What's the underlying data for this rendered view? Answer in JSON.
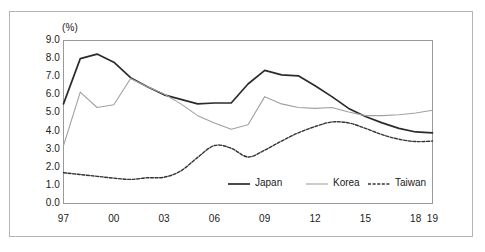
{
  "chart_data": {
    "type": "line",
    "title": "",
    "subtitle": "",
    "xlabel": "",
    "ylabel": "",
    "unit_label": "(%)",
    "x": [
      1997,
      1998,
      1999,
      2000,
      2001,
      2002,
      2003,
      2004,
      2005,
      2006,
      2007,
      2008,
      2009,
      2010,
      2011,
      2012,
      2013,
      2014,
      2015,
      2016,
      2017,
      2018,
      2019
    ],
    "xtick_labels": [
      "97",
      "00",
      "03",
      "06",
      "09",
      "12",
      "15",
      "18",
      "19"
    ],
    "xtick_values": [
      1997,
      2000,
      2003,
      2006,
      2009,
      2012,
      2015,
      2018,
      2019
    ],
    "ytick_labels": [
      "0.0",
      "1.0",
      "2.0",
      "3.0",
      "4.0",
      "5.0",
      "6.0",
      "7.0",
      "8.0",
      "9.0"
    ],
    "ytick_values": [
      0.0,
      1.0,
      2.0,
      3.0,
      4.0,
      5.0,
      6.0,
      7.0,
      8.0,
      9.0
    ],
    "ylim": [
      0.0,
      9.0
    ],
    "xlim": [
      1997,
      2019
    ],
    "grid": false,
    "legend_position": "inside-bottom-center",
    "series": [
      {
        "name": "Japan",
        "color": "#2b2b2b",
        "style": "solid",
        "values": [
          5.5,
          8.0,
          8.25,
          7.8,
          6.95,
          6.45,
          6.0,
          5.75,
          5.5,
          5.55,
          5.55,
          6.6,
          7.35,
          7.1,
          7.05,
          6.5,
          5.9,
          5.25,
          4.8,
          4.45,
          4.15,
          3.95,
          3.9
        ]
      },
      {
        "name": "Korea",
        "color": "#a0a0a0",
        "style": "solid",
        "values": [
          3.2,
          6.15,
          5.3,
          5.45,
          6.9,
          6.45,
          6.05,
          5.5,
          4.85,
          4.45,
          4.1,
          4.35,
          5.9,
          5.5,
          5.3,
          5.25,
          5.3,
          5.05,
          4.85,
          4.85,
          4.9,
          5.0,
          5.15
        ]
      },
      {
        "name": "Taiwan",
        "color": "#333333",
        "style": "dashed",
        "values": [
          1.7,
          1.6,
          1.5,
          1.4,
          1.33,
          1.42,
          1.45,
          1.8,
          2.55,
          3.2,
          3.05,
          2.57,
          2.95,
          3.45,
          3.9,
          4.25,
          4.5,
          4.45,
          4.15,
          3.8,
          3.55,
          3.42,
          3.45
        ]
      }
    ]
  },
  "legend": {
    "items": [
      {
        "label": "Japan"
      },
      {
        "label": "Korea"
      },
      {
        "label": "Taiwan"
      }
    ]
  }
}
